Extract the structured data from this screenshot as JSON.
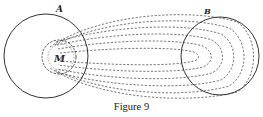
{
  "diagram": {
    "labels": {
      "outer_left_circle": "A",
      "right_circle": "B",
      "inner_circle": "M"
    },
    "caption": "Figure 9",
    "colors": {
      "stroke": "#333333",
      "dashes": "#555555",
      "background": "#ffffff"
    }
  }
}
